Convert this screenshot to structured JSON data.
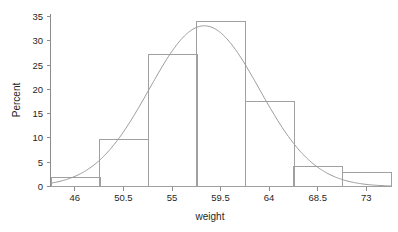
{
  "chart_data": {
    "type": "bar",
    "title": "",
    "subtitle": "",
    "xlabel": "weight",
    "ylabel": "Percent",
    "grid": false,
    "legend": null,
    "xlim": [
      43.75,
      75.25
    ],
    "ylim": [
      0,
      36.5
    ],
    "x_ticks": [
      46,
      50.5,
      55,
      59.5,
      64,
      68.5,
      73
    ],
    "x_tick_labels": [
      "46",
      "50.5",
      "55",
      "59.5",
      "64",
      "68.5",
      "73"
    ],
    "y_ticks": [
      0,
      5,
      10,
      15,
      20,
      25,
      30,
      35
    ],
    "y_tick_labels": [
      "0",
      "5",
      "10",
      "15",
      "20",
      "25",
      "30",
      "35"
    ],
    "bin_width": 4.5,
    "bin_edges": [
      43.75,
      48.25,
      52.75,
      57.25,
      61.75,
      66.25,
      70.75,
      75.25
    ],
    "bin_centers": [
      46,
      50.5,
      55,
      59.5,
      64,
      68.5,
      73
    ],
    "categories": [
      "46",
      "50.5",
      "55",
      "59.5",
      "64",
      "68.5",
      "73"
    ],
    "values": [
      2,
      10,
      28,
      35,
      18,
      4.3,
      3
    ],
    "series": [
      {
        "name": "Percent",
        "type": "histogram",
        "values": [
          2,
          10,
          28,
          35,
          18,
          4.3,
          3
        ]
      },
      {
        "name": "Normal density overlay",
        "type": "line",
        "peak_x": 58,
        "peak_y": 34,
        "mean": 58,
        "std_dev": 5.1
      }
    ],
    "colors": {
      "bar_stroke": "#a0a0a0",
      "bar_fill": "none",
      "curve": "#9a9a9a",
      "axis": "#8c8c8c",
      "text": "#1f1f1f",
      "background": "#ffffff"
    }
  },
  "axes": {
    "y_title": "Percent",
    "x_title": "weight"
  }
}
